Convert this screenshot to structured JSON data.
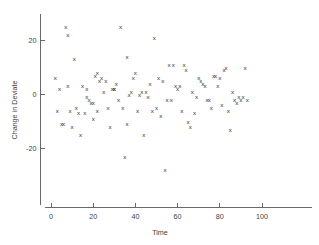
{
  "chart_data": {
    "type": "scatter",
    "title": "",
    "xlabel": "Time",
    "ylabel": "Change in Deviate",
    "xlim": [
      -3,
      112
    ],
    "ylim": [
      -36,
      30
    ],
    "grid": false,
    "legend": null,
    "marker": "x",
    "marker_color": "#2e2e2e",
    "xticks": [
      0,
      20,
      40,
      60,
      80,
      100
    ],
    "xtick_labels": [
      "0",
      "20",
      "40",
      "60",
      "80",
      "100"
    ],
    "yticks": [
      20,
      0,
      -20
    ],
    "ytick_labels": [
      "20",
      "0",
      "-20"
    ],
    "x": [
      2,
      3,
      4,
      5,
      6,
      7,
      8,
      8,
      9,
      10,
      11,
      12,
      13,
      14,
      15,
      16,
      17,
      17,
      18,
      19,
      20,
      20,
      21,
      22,
      22,
      23,
      24,
      25,
      26,
      27,
      28,
      29,
      30,
      30,
      31,
      32,
      33,
      34,
      35,
      36,
      36,
      37,
      38,
      39,
      40,
      41,
      42,
      43,
      44,
      45,
      46,
      47,
      48,
      49,
      50,
      51,
      52,
      53,
      54,
      55,
      56,
      57,
      58,
      59,
      60,
      61,
      62,
      63,
      64,
      65,
      66,
      67,
      68,
      69,
      70,
      71,
      72,
      73,
      74,
      75,
      76,
      77,
      78,
      79,
      80,
      81,
      82,
      83,
      84,
      85,
      86,
      87,
      88,
      89,
      90,
      91,
      92,
      93,
      94,
      95,
      96,
      97,
      98,
      99,
      100,
      101,
      102,
      103
    ],
    "y": [
      6,
      -6,
      2,
      -11,
      -11,
      25,
      22,
      3,
      -6,
      -12,
      13,
      -5,
      -7,
      -15,
      3,
      -7,
      -1,
      2,
      -2,
      -3,
      -3,
      -9,
      7,
      8,
      -6,
      5,
      6,
      1,
      5,
      -5,
      -12,
      2,
      2,
      2,
      4,
      -2,
      25,
      -5,
      -23,
      14,
      -11,
      0,
      1,
      6,
      8,
      -6,
      0,
      1,
      -15,
      1,
      -1,
      4,
      -6,
      21,
      -5,
      6,
      -8,
      5,
      -28,
      -2,
      11,
      -2,
      11,
      3,
      2,
      3,
      -6,
      11,
      9,
      -10,
      -12,
      1,
      -7,
      -1,
      6,
      5,
      4,
      3,
      -2,
      -2,
      -5,
      7,
      7,
      3,
      6,
      -4,
      9,
      10,
      -6,
      -13,
      1,
      -2,
      -3,
      -1,
      -2,
      -1,
      10,
      -2
    ]
  },
  "figure": {
    "background": "#ffffff",
    "axis_color": "#5a5a5a",
    "text_color": "#3f3f3f"
  }
}
